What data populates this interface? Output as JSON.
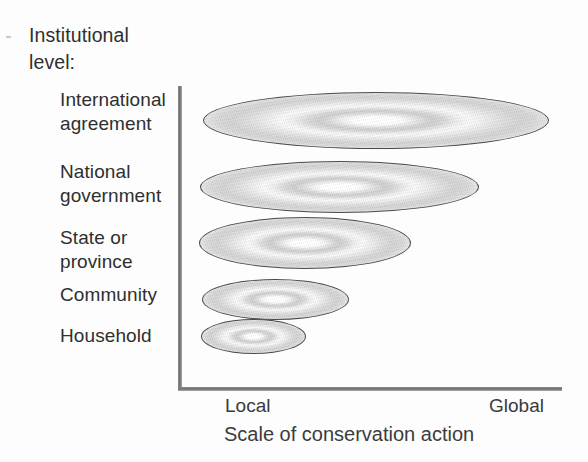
{
  "figure": {
    "axis_title_y": "Institutional\nlevel:",
    "axis_tick_left": "Local",
    "axis_tick_right": "Global",
    "axis_title_x": "Scale of conservation action",
    "ink_color": "#2f2f2f",
    "axis_color": "#6f6f6f",
    "ellipse_outline_color": "#4a4a4a"
  },
  "chart_data": {
    "type": "bar",
    "xlabel": "Scale of conservation action",
    "ylabel": "Institutional level:",
    "orientation": "horizontal",
    "grid": false,
    "legend": false,
    "x_tick_labels": [
      "Local",
      "Global"
    ],
    "xlim": [
      0,
      100
    ],
    "categories": [
      "International agreement",
      "National government",
      "State or province",
      "Community",
      "Household"
    ],
    "values": [
      100,
      79,
      60,
      41,
      29
    ],
    "marks": [
      {
        "category": "International agreement",
        "label": "International\nagreement",
        "label_top": 88,
        "left": 203,
        "top": 92,
        "width": 346,
        "height": 57
      },
      {
        "category": "National government",
        "label": "National\ngovernment",
        "label_top": 160,
        "left": 200,
        "top": 161,
        "width": 279,
        "height": 52
      },
      {
        "category": "State or province",
        "label": "State or\nprovince",
        "label_top": 226,
        "left": 199,
        "top": 217,
        "width": 212,
        "height": 52
      },
      {
        "category": "Community",
        "label": "Community",
        "label_top": 283,
        "left": 202,
        "top": 279,
        "width": 147,
        "height": 41
      },
      {
        "category": "Household",
        "label": "Household",
        "label_top": 324,
        "left": 201,
        "top": 319,
        "width": 105,
        "height": 35
      }
    ]
  }
}
